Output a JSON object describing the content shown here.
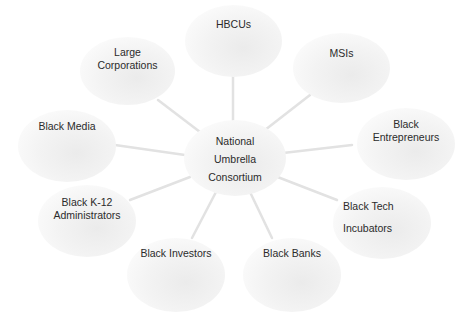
{
  "diagram": {
    "center": {
      "lines": [
        "National",
        "Umbrella",
        "Consortium"
      ]
    },
    "nodes": [
      {
        "id": "hbcus",
        "lines": [
          "HBCUs"
        ]
      },
      {
        "id": "msis",
        "lines": [
          "MSIs"
        ]
      },
      {
        "id": "black-entrepreneurs",
        "lines": [
          "Black",
          "Entrepreneurs"
        ]
      },
      {
        "id": "black-tech-incubators",
        "lines": [
          "Black Tech",
          "Incubators"
        ]
      },
      {
        "id": "black-banks",
        "lines": [
          "Black Banks"
        ]
      },
      {
        "id": "black-investors",
        "lines": [
          "Black Investors"
        ]
      },
      {
        "id": "black-k12-administrators",
        "lines": [
          "Black K-12",
          "Administrators"
        ]
      },
      {
        "id": "black-media",
        "lines": [
          "Black Media"
        ]
      },
      {
        "id": "large-corporations",
        "lines": [
          "Large",
          "Corporations"
        ]
      }
    ],
    "colors": {
      "node_fill": "#f0f0f0",
      "connector": "#e2e2e2",
      "text": "#2b2b2b"
    }
  }
}
